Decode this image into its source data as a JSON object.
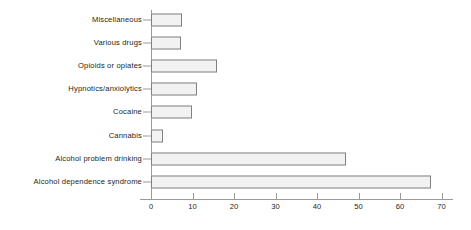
{
  "chart_data": {
    "type": "bar",
    "orientation": "horizontal",
    "title": "",
    "xlabel": "",
    "ylabel": "",
    "xlim": [
      0,
      70
    ],
    "ylim": null,
    "grid": false,
    "legend": null,
    "xticks": [
      0,
      10,
      20,
      30,
      40,
      50,
      60,
      70
    ],
    "xtick_labels": [
      "0",
      "10",
      "20",
      "30",
      "40",
      "50",
      "60",
      "70"
    ],
    "categories": [
      "Miscellaneous",
      "Various drugs",
      "Opioids or opiates",
      "Hypnotics/anxiolytics",
      "Cocaine",
      "Cannabis",
      "Alcohol problem drinking",
      "Alcohol dependence syndrome"
    ],
    "values": [
      7.5,
      7.3,
      16,
      11.2,
      9.8,
      3,
      47,
      67.5
    ],
    "bar_fill_color": "#f2f2f2",
    "bar_edge_color": "#808080",
    "axis_color": "#9a9a9a",
    "text_color": "#231f20"
  }
}
